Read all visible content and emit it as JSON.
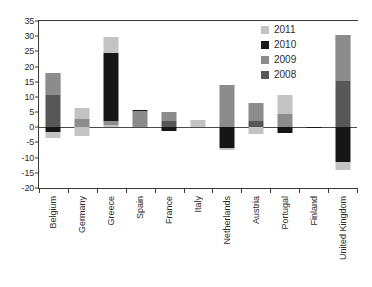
{
  "chart_data": {
    "type": "bar",
    "subtype": "stacked-diverging",
    "title": "",
    "xlabel": "",
    "ylabel": "",
    "ylim": [
      -20,
      35
    ],
    "ytick_step": 5,
    "yticks": [
      "35",
      "30",
      "25",
      "20",
      "15",
      "10",
      "5",
      "0",
      "-5",
      "-10",
      "-15",
      "-20"
    ],
    "grid": false,
    "legend_position": "top-right",
    "categories": [
      "Belgium",
      "Germany",
      "Greece",
      "Spain",
      "France",
      "Italy",
      "Netherlands",
      "Austria",
      "Portugal",
      "Finland",
      "United Kingdom"
    ],
    "series": [
      {
        "name": "2008",
        "color": "#575757",
        "values": [
          10.6,
          0.0,
          0.0,
          0.0,
          2.2,
          0.0,
          0.0,
          2.2,
          0.0,
          0.0,
          0.0
        ]
      },
      {
        "name": "2009",
        "color": "#8c8c8c",
        "values": [
          7.3,
          2.6,
          0.0,
          5.2,
          2.9,
          0.0,
          13.8,
          5.8,
          4.5,
          0.0,
          14.9
        ]
      },
      {
        "name": "2010",
        "color": "#161616",
        "values": [
          -1.5,
          0.0,
          23.3,
          0.6,
          -1.1,
          0.0,
          -6.9,
          0.0,
          -2.0,
          -0.4,
          -11.4
        ]
      },
      {
        "name": "2011",
        "color": "#c3c3c3",
        "values": [
          -2.2,
          -3.0,
          6.4,
          0.0,
          0.0,
          2.3,
          -0.6,
          -2.3,
          6.1,
          0.0,
          -2.8
        ]
      }
    ],
    "stack_segments": [
      {
        "category": "Belgium",
        "segments": [
          {
            "series": "2011",
            "from": 10.6,
            "to": 17.9
          },
          {
            "series": "2009",
            "from": 10.6,
            "to": 17.9
          },
          {
            "series": "2008",
            "from": 0.0,
            "to": 10.6
          },
          {
            "series": "2010",
            "from": -1.5,
            "to": 0.0
          },
          {
            "series": "2011neg",
            "from": -3.7,
            "to": -1.5
          }
        ]
      },
      {
        "category": "Germany",
        "segments": [
          {
            "series": "2011",
            "from": 2.6,
            "to": 6.5
          },
          {
            "series": "2009",
            "from": 0.0,
            "to": 2.6
          },
          {
            "series": "2011neg",
            "from": -3.0,
            "to": 0.0
          }
        ]
      },
      {
        "category": "Greece",
        "segments": [
          {
            "series": "2011",
            "from": 24.5,
            "to": 29.8
          },
          {
            "series": "2010",
            "from": 2.2,
            "to": 24.5
          },
          {
            "series": "2009",
            "from": 0.9,
            "to": 2.2
          },
          {
            "series": "2011b",
            "from": 0.0,
            "to": 0.9
          }
        ]
      },
      {
        "category": "Spain",
        "segments": [
          {
            "series": "2010",
            "from": 5.2,
            "to": 5.8
          },
          {
            "series": "2009",
            "from": 0.0,
            "to": 5.2
          }
        ]
      },
      {
        "category": "France",
        "segments": [
          {
            "series": "2009",
            "from": 2.2,
            "to": 5.1
          },
          {
            "series": "2008",
            "from": 0.0,
            "to": 2.2
          },
          {
            "series": "2010",
            "from": -1.1,
            "to": 0.0
          }
        ]
      },
      {
        "category": "Italy",
        "segments": [
          {
            "series": "2011",
            "from": 0.0,
            "to": 2.3
          }
        ]
      },
      {
        "category": "Netherlands",
        "segments": [
          {
            "series": "2009",
            "from": 0.0,
            "to": 13.8
          },
          {
            "series": "2010",
            "from": -6.9,
            "to": 0.0
          },
          {
            "series": "2011neg",
            "from": -7.5,
            "to": -6.9
          }
        ]
      },
      {
        "category": "Austria",
        "segments": [
          {
            "series": "2009",
            "from": 2.2,
            "to": 8.0
          },
          {
            "series": "2008",
            "from": 0.0,
            "to": 2.2
          },
          {
            "series": "2011neg",
            "from": -2.3,
            "to": 0.0
          }
        ]
      },
      {
        "category": "Portugal",
        "segments": [
          {
            "series": "2011",
            "from": 4.5,
            "to": 10.6
          },
          {
            "series": "2009",
            "from": 0.0,
            "to": 4.5
          },
          {
            "series": "2010",
            "from": -2.0,
            "to": 0.0
          }
        ]
      },
      {
        "category": "Finland",
        "segments": [
          {
            "series": "2010",
            "from": -0.4,
            "to": 0.0
          }
        ]
      },
      {
        "category": "United Kingdom",
        "segments": [
          {
            "series": "2011",
            "from": 15.4,
            "to": 30.3
          },
          {
            "series": "2009",
            "from": 15.4,
            "to": 30.3
          },
          {
            "series": "2008",
            "from": 0.0,
            "to": 15.4
          },
          {
            "series": "2010",
            "from": -11.4,
            "to": 0.0
          },
          {
            "series": "2011neg",
            "from": -14.2,
            "to": -11.4
          }
        ]
      }
    ]
  },
  "legend": {
    "entries": [
      {
        "label": "2011",
        "color": "#c3c3c3"
      },
      {
        "label": "2010",
        "color": "#161616"
      },
      {
        "label": "2009",
        "color": "#8c8c8c"
      },
      {
        "label": "2008",
        "color": "#575757"
      }
    ]
  }
}
